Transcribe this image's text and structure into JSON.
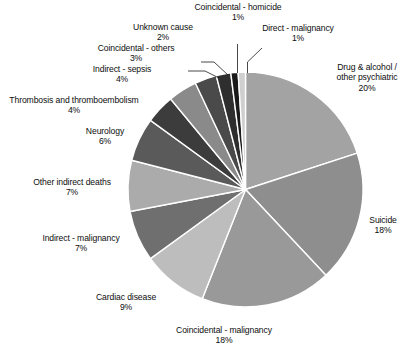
{
  "chart_data": {
    "type": "pie",
    "title": "",
    "subtitle": "",
    "xlabel": "",
    "ylabel": "",
    "legend_position": "none",
    "grid": false,
    "value_unit": "%",
    "start_angle_deg": 0,
    "direction": "clockwise",
    "center": {
      "x": 245.5,
      "y": 189.5
    },
    "radius": 117.5,
    "slice_border_color": "#ffffff",
    "categories": [
      "Drug & alcohol / other psychiatric",
      "Suicide",
      "Coincidental - malignancy",
      "Cardiac disease",
      "Indirect - malignancy",
      "Other indirect deaths",
      "Neurology",
      "Thrombosis and thromboembolism",
      "Indirect - sepsis",
      "Coincidental - others",
      "Unknown cause",
      "Coincidental - homicide",
      "Direct - malignancy"
    ],
    "values": [
      20,
      18,
      18,
      9,
      7,
      7,
      6,
      4,
      4,
      3,
      2,
      1,
      1
    ],
    "colors": [
      "#a3a3a3",
      "#8e8e8e",
      "#999999",
      "#bdbdbd",
      "#6f6f6f",
      "#ababab",
      "#5a5a5a",
      "#3c3c3c",
      "#8a8a8a",
      "#4a4a4a",
      "#2e2e2e",
      "#1a1a1a",
      "#cfcfcf"
    ],
    "slices": [
      {
        "label": "Drug & alcohol / other psychiatric",
        "value": 20,
        "value_text": "20%",
        "color": "#a3a3a3"
      },
      {
        "label": "Suicide",
        "value": 18,
        "value_text": "18%",
        "color": "#8e8e8e"
      },
      {
        "label": "Coincidental - malignancy",
        "value": 18,
        "value_text": "18%",
        "color": "#999999"
      },
      {
        "label": "Cardiac disease",
        "value": 9,
        "value_text": "9%",
        "color": "#bdbdbd"
      },
      {
        "label": "Indirect - malignancy",
        "value": 7,
        "value_text": "7%",
        "color": "#6f6f6f"
      },
      {
        "label": "Other indirect deaths",
        "value": 7,
        "value_text": "7%",
        "color": "#ababab"
      },
      {
        "label": "Neurology",
        "value": 6,
        "value_text": "6%",
        "color": "#5a5a5a"
      },
      {
        "label": "Thrombosis and thromboembolism",
        "value": 4,
        "value_text": "4%",
        "color": "#3c3c3c"
      },
      {
        "label": "Indirect - sepsis",
        "value": 4,
        "value_text": "4%",
        "color": "#8a8a8a"
      },
      {
        "label": "Coincidental - others",
        "value": 3,
        "value_text": "3%",
        "color": "#4a4a4a"
      },
      {
        "label": "Unknown cause",
        "value": 2,
        "value_text": "2%",
        "color": "#2e2e2e"
      },
      {
        "label": "Coincidental - homicide",
        "value": 1,
        "value_text": "1%",
        "color": "#1a1a1a"
      },
      {
        "label": "Direct - malignancy",
        "value": 1,
        "value_text": "1%",
        "color": "#cfcfcf"
      }
    ]
  },
  "labels": {
    "coincidental_homicide": {
      "name": "Coincidental - homicide",
      "value": "1%"
    },
    "direct_malignancy": {
      "name": "Direct - malignancy",
      "value": "1%"
    },
    "unknown_cause": {
      "name": "Unknown cause",
      "value": "2%"
    },
    "coincidental_others": {
      "name": "Coincidental - others",
      "value": "3%"
    },
    "indirect_sepsis": {
      "name": "Indirect - sepsis",
      "value": "4%"
    },
    "thrombosis": {
      "name": "Thrombosis and thromboembolism",
      "value": "4%"
    },
    "neurology": {
      "name": "Neurology",
      "value": "6%"
    },
    "other_indirect_deaths": {
      "name": "Other indirect deaths",
      "value": "7%"
    },
    "indirect_malignancy": {
      "name": "Indirect - malignancy",
      "value": "7%"
    },
    "cardiac_disease": {
      "name": "Cardiac disease",
      "value": "9%"
    },
    "coincidental_malignancy": {
      "name": "Coincidental - malignancy",
      "value": "18%"
    },
    "suicide": {
      "name": "Suicide",
      "value": "18%"
    },
    "drug_alcohol": {
      "name_line1": "Drug & alcohol /",
      "name_line2": "other psychiatric",
      "value": "20%"
    }
  }
}
